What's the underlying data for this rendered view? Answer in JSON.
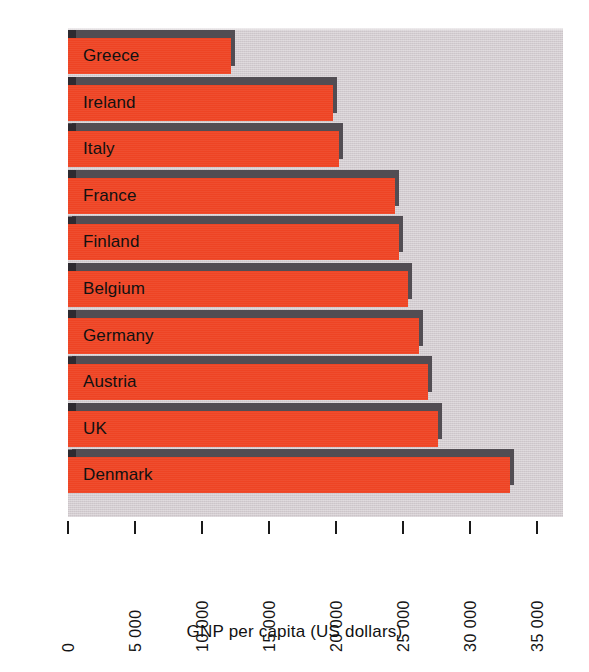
{
  "chart_data": {
    "type": "bar",
    "orientation": "horizontal",
    "title": "",
    "xlabel": "GNP per capita (US dollars)",
    "ylabel": "EU members",
    "categories": [
      "Greece",
      "Ireland",
      "Italy",
      "France",
      "Finland",
      "Belgium",
      "Germany",
      "Austria",
      "UK",
      "Denmark"
    ],
    "values": [
      12200,
      19800,
      20200,
      24400,
      24700,
      25400,
      26200,
      26900,
      27600,
      33000
    ],
    "xlim": [
      0,
      35000
    ],
    "ylim": null,
    "xticks": [
      0,
      5000,
      10000,
      15000,
      20000,
      25000,
      30000,
      35000
    ],
    "xtick_labels": [
      "0",
      "5 000",
      "10 000",
      "15 000",
      "20 000",
      "25 000",
      "30 000",
      "35 000"
    ],
    "grid": false,
    "legend": null,
    "bar_color": "#ee4424",
    "bar_shadow_color": "#524d53",
    "plot_background": "#d3ccd0",
    "figure_background": "#ffffff",
    "label_color": "#111111"
  },
  "axes": {
    "x_title": "GNP per capita (US dollars)",
    "y_title": "EU members"
  },
  "bars": [
    {
      "label": "Greece",
      "value": 12200
    },
    {
      "label": "Ireland",
      "value": 19800
    },
    {
      "label": "Italy",
      "value": 20200
    },
    {
      "label": "France",
      "value": 24400
    },
    {
      "label": "Finland",
      "value": 24700
    },
    {
      "label": "Belgium",
      "value": 25400
    },
    {
      "label": "Germany",
      "value": 26200
    },
    {
      "label": "Austria",
      "value": 26900
    },
    {
      "label": "UK",
      "value": 27600
    },
    {
      "label": "Denmark",
      "value": 33000
    }
  ],
  "ticks": [
    {
      "value": 0,
      "label": "0"
    },
    {
      "value": 5000,
      "label": "5 000"
    },
    {
      "value": 10000,
      "label": "10 000"
    },
    {
      "value": 15000,
      "label": "15 000"
    },
    {
      "value": 20000,
      "label": "20 000"
    },
    {
      "value": 25000,
      "label": "25 000"
    },
    {
      "value": 30000,
      "label": "30 000"
    },
    {
      "value": 35000,
      "label": "35 000"
    }
  ]
}
